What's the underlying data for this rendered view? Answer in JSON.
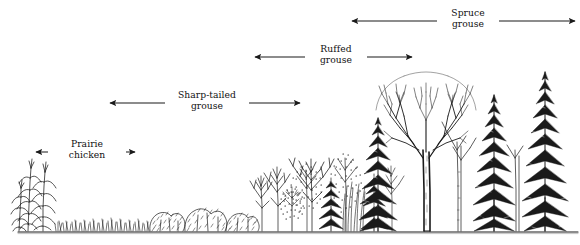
{
  "figure": {
    "type": "habitat-succession-gradient-diagram",
    "width": 580,
    "height": 245,
    "background_color": "#ffffff",
    "ink_color": "#1a1a1a",
    "ground_line_y": 232
  },
  "species_ranges": [
    {
      "id": "prairie-chicken",
      "label": "Prairie\nchicken",
      "label_line1": "Prairie",
      "label_line2": "chicken",
      "arrow_y": 152,
      "x_start": 36,
      "x_end": 135,
      "left_head": true,
      "right_head": true,
      "label_cx": 85,
      "label_top": 139
    },
    {
      "id": "sharp-tailed-grouse",
      "label": "Sharp-tailed\ngrouse",
      "label_line1": "Sharp-tailed",
      "label_line2": "grouse",
      "arrow_y": 103,
      "x_start": 110,
      "x_end": 300,
      "left_head": true,
      "right_head": true,
      "label_cx": 205,
      "label_top": 90
    },
    {
      "id": "ruffed-grouse",
      "label": "Ruffed\ngrouse",
      "label_line1": "Ruffed",
      "label_line2": "grouse",
      "arrow_y": 57,
      "x_start": 255,
      "x_end": 412,
      "left_head": true,
      "right_head": true,
      "label_cx": 334,
      "label_top": 44
    },
    {
      "id": "spruce-grouse",
      "label": "Spruce\ngrouse",
      "label_line1": "Spruce",
      "label_line2": "grouse",
      "arrow_y": 21,
      "x_start": 352,
      "x_end": 575,
      "left_head": true,
      "right_head": true,
      "label_cx": 465,
      "label_top": 8
    }
  ],
  "vegetation_profile": {
    "description": "Left-to-right ecological succession: cornfield, grassland, low shrubs, young deciduous saplings, mixed deciduous, mature deciduous with conifers, mature spruce forest.",
    "stages": [
      {
        "name": "corn-stalks",
        "x": 40,
        "height": 70
      },
      {
        "name": "grass",
        "x": 110,
        "height": 14
      },
      {
        "name": "low-shrubs",
        "x": 175,
        "height": 24
      },
      {
        "name": "young-saplings",
        "x": 230,
        "height": 55
      },
      {
        "name": "mixed-deciduous",
        "x": 285,
        "height": 80
      },
      {
        "name": "mature-deciduous",
        "x": 360,
        "height": 140
      },
      {
        "name": "conifer-stand",
        "x": 470,
        "height": 175
      },
      {
        "name": "mature-spruce",
        "x": 540,
        "height": 190
      }
    ]
  }
}
